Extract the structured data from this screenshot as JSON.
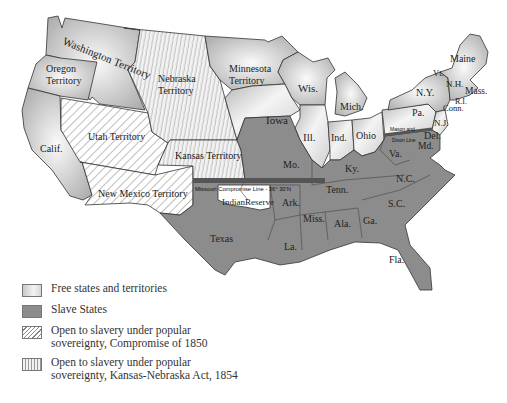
{
  "map": {
    "title": "",
    "colors": {
      "free": "#e8e8e8",
      "slave": "#8c8c8c",
      "compromise_1850": "#ffffff",
      "kansas_nebraska_1854": "#f2f2f2",
      "border": "#333333",
      "missouri_line": "#555555"
    },
    "regions": {
      "washington": "Washington Territory",
      "oregon_line1": "Oregon",
      "oregon_line2": "Territory",
      "calif": "Calif.",
      "utah": "Utah Territory",
      "new_mexico": "New Mexico Territory",
      "nebraska_line1": "Nebraska",
      "nebraska_line2": "Territory",
      "kansas": "Kansas Territory",
      "minnesota_line1": "Minnesota",
      "minnesota_line2": "Territory",
      "iowa": "Iowa",
      "wis": "Wis.",
      "mich": "Mich.",
      "ill": "Ill.",
      "ind": "Ind.",
      "ohio": "Ohio",
      "pa": "Pa.",
      "ny": "N.Y.",
      "vt": "Vt.",
      "nh": "N.H.",
      "maine": "Maine",
      "mass": "Mass.",
      "ri": "R.I.",
      "conn": "Conn.",
      "nj": "N.J.",
      "del": "Del.",
      "md": "Md.",
      "va": "Va.",
      "nc": "N.C.",
      "sc": "S.C.",
      "ga": "Ga.",
      "fla": "Fla.",
      "ala": "Ala.",
      "miss": "Miss.",
      "la": "La.",
      "ark": "Ark.",
      "tenn": "Tenn.",
      "ky": "Ky.",
      "mo": "Mo.",
      "texas": "Texas",
      "indian_reserve": "IndianReserve"
    },
    "lines": {
      "missouri_compromise": "Missouri Compromise Line - 36° 30'N",
      "mason_dixon_line1": "Mason and",
      "mason_dixon_line2": "Dixon Line"
    }
  },
  "legend": {
    "items": [
      {
        "key": "free",
        "label": "Free states and territories"
      },
      {
        "key": "slave",
        "label": "Slave States"
      },
      {
        "key": "compromise_1850",
        "label": "Open to slavery under popular sovereignty, Compromise of 1850"
      },
      {
        "key": "kansas_nebraska_1854",
        "label": "Open to slavery under popular sovereignty, Kansas-Nebraska Act, 1854"
      }
    ]
  }
}
